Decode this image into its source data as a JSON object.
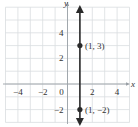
{
  "chart_data": {
    "type": "line",
    "title": "",
    "xlabel": "x",
    "ylabel": "y",
    "xlim": [
      -5,
      5
    ],
    "ylim": [
      -3,
      6
    ],
    "grid": true,
    "x_ticks": [
      {
        "value": -4,
        "label": "−4"
      },
      {
        "value": -2,
        "label": "−2"
      },
      {
        "value": 0,
        "label": "0"
      },
      {
        "value": 2,
        "label": "2"
      },
      {
        "value": 4,
        "label": "4"
      }
    ],
    "y_ticks": [
      {
        "value": 4,
        "label": "4"
      },
      {
        "value": 2,
        "label": "2"
      },
      {
        "value": -2,
        "label": "−2"
      }
    ],
    "series": [
      {
        "name": "x = 1",
        "kind": "vertical-line",
        "x": 1,
        "arrows": "both",
        "color": "#2a2a2a"
      }
    ],
    "points": [
      {
        "x": 1,
        "y": 3,
        "label": "(1, 3)"
      },
      {
        "x": 1,
        "y": -2,
        "label": "(1, −2)"
      }
    ]
  }
}
